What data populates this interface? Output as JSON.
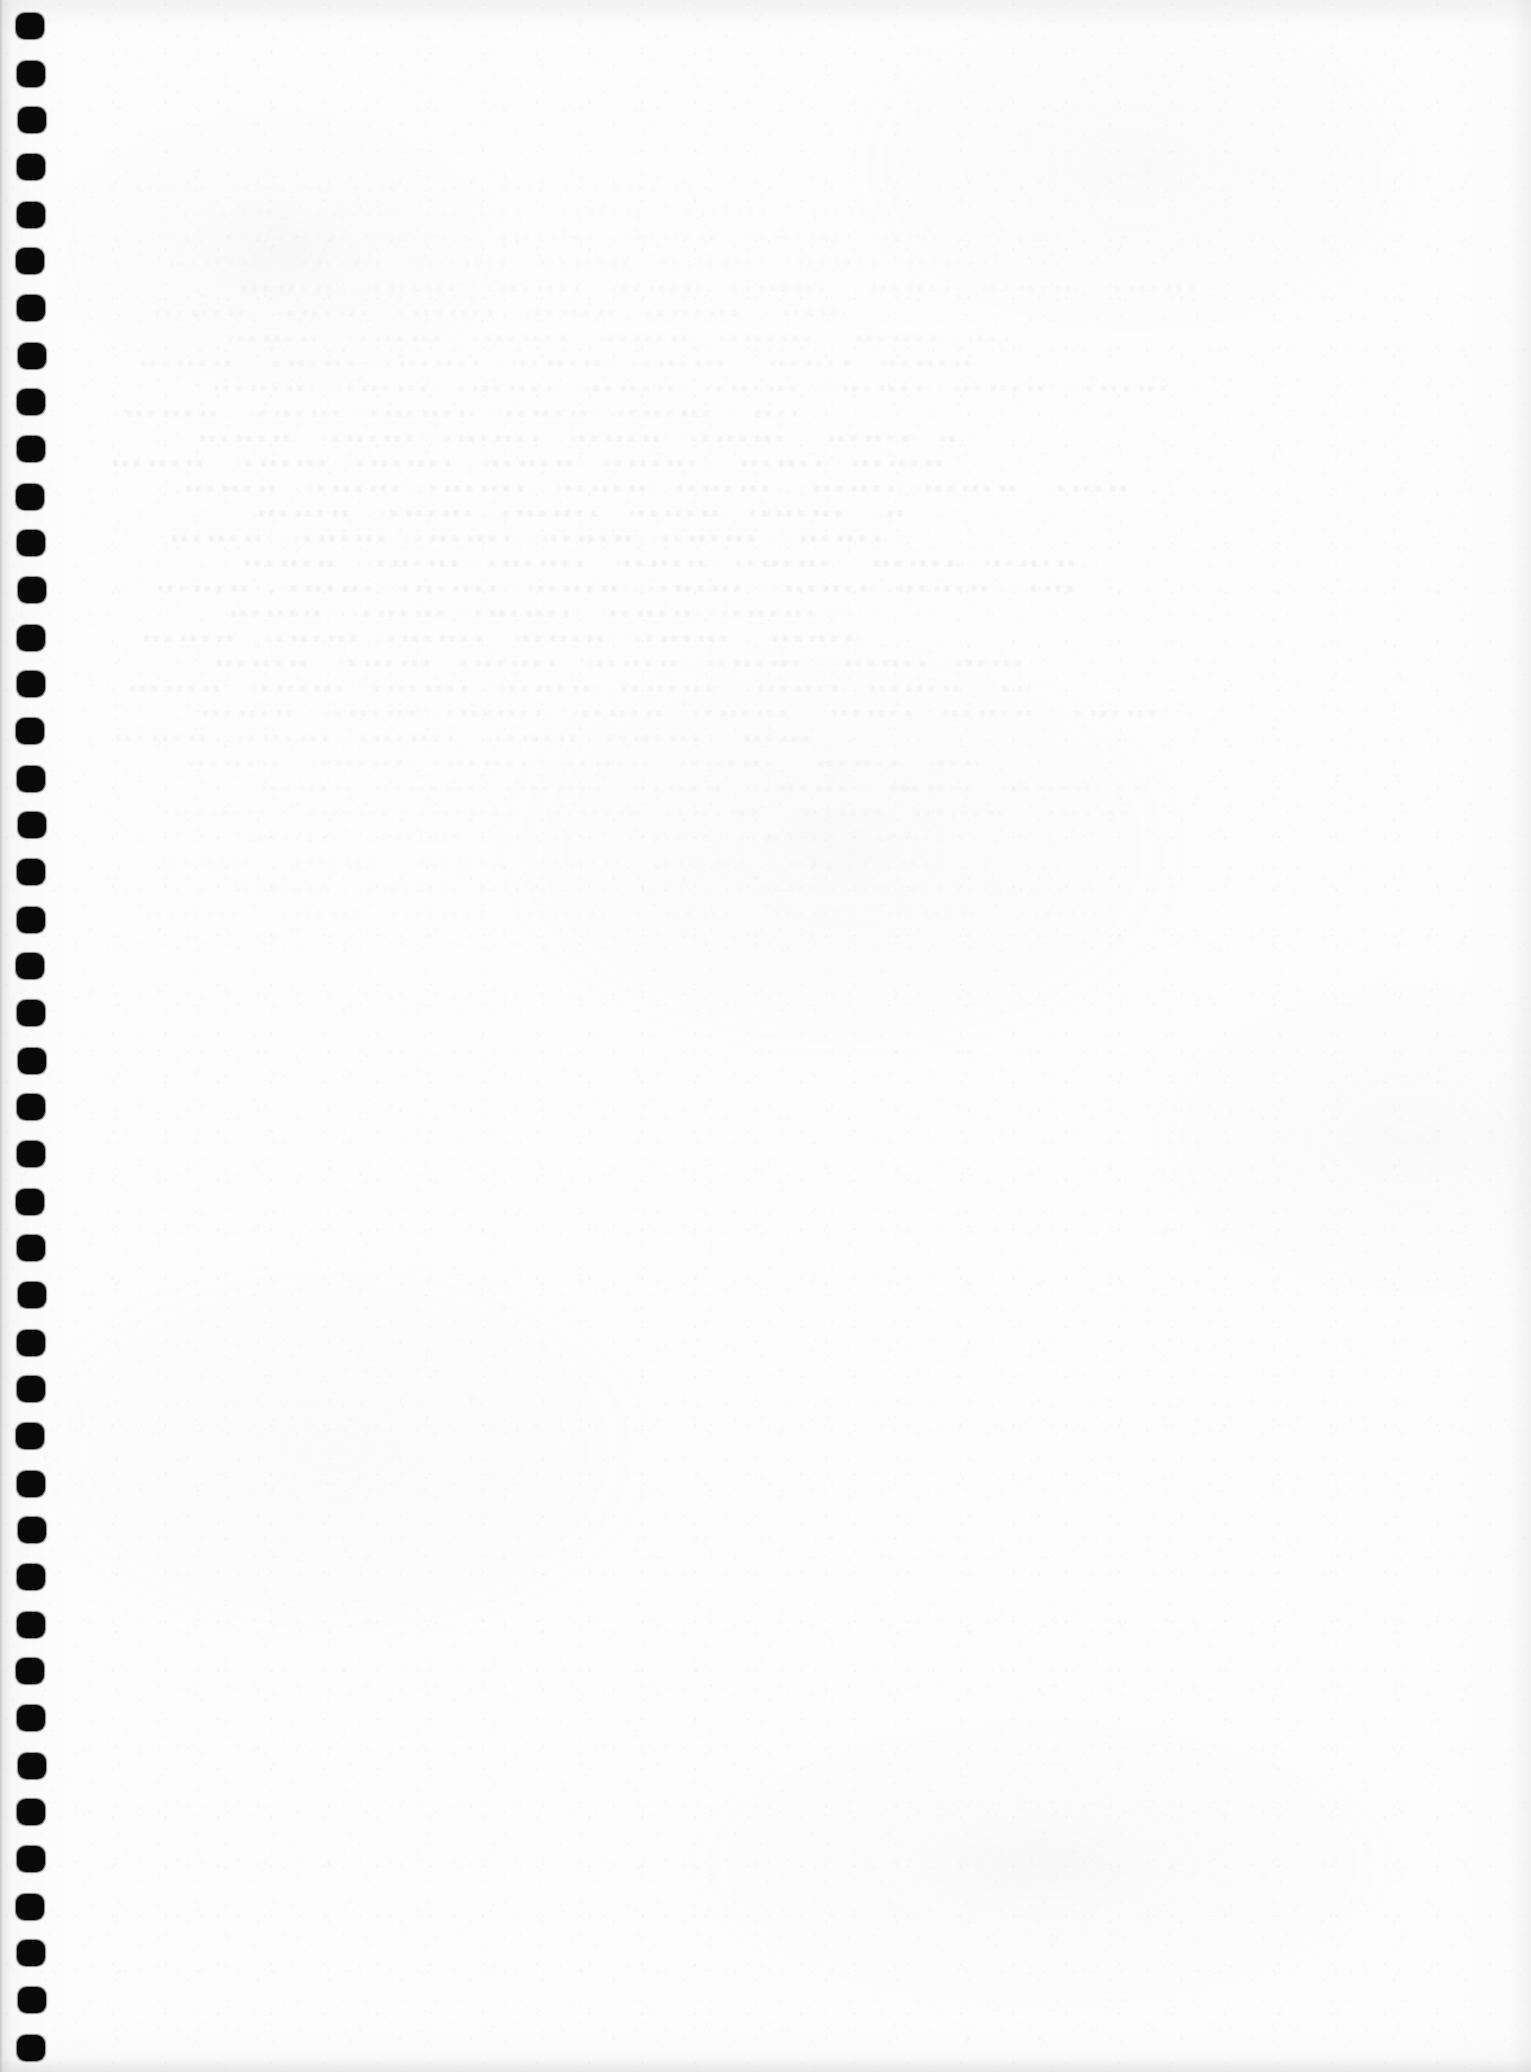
{
  "document": {
    "kind": "scanned-page",
    "title": "Scanned blank notebook page",
    "page_label": "",
    "visible_text": "",
    "has_printed_text": false,
    "surface": {
      "description": "Blank off-white lined-notebook sheet scanned flat",
      "paper_color": "#fdfdfd",
      "background_color": "#ffffff",
      "edge_shadow_color": "#c4c4c6",
      "grain_color": "#a8a8ac"
    }
  },
  "binding": {
    "name": "punched-binding-holes",
    "edge": "left",
    "hole_count": 44,
    "hole_color": "#090909",
    "hole_width_px": 28,
    "hole_height_px": 26,
    "hole_left_px": 17,
    "first_hole_top_px": 13,
    "hole_pitch_px": 47,
    "corner_radius_px": 9
  },
  "ghost_marks": {
    "name": "bleed-through-ghost-text",
    "legible": false,
    "note": "Faint illegible show-through of writing from the reverse side of the sheet",
    "color": "#b0b0b6",
    "region": {
      "left_px": 110,
      "top_px": 185,
      "width_px": 1000,
      "height_px": 760
    },
    "line_count": 30,
    "line_height_px": 7,
    "line_gap_px": 18
  },
  "canvas": {
    "width_px": 1531,
    "height_px": 2072
  }
}
